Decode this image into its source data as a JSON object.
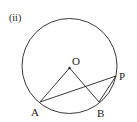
{
  "figure": {
    "label": "(ii)",
    "points": {
      "O": "O",
      "A": "A",
      "B": "B",
      "P": "P"
    }
  },
  "colors": {
    "stroke": "#222222",
    "background": "#ffffff"
  }
}
